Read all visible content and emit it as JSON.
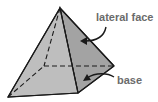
{
  "diagram": {
    "labels": {
      "lateral_face": "lateral face",
      "base": "base"
    },
    "colors": {
      "front_face": "#bdbdbd",
      "side_face": "#a2a2a2",
      "edge": "#1a1a1a",
      "label": "#6b6b6b"
    }
  }
}
